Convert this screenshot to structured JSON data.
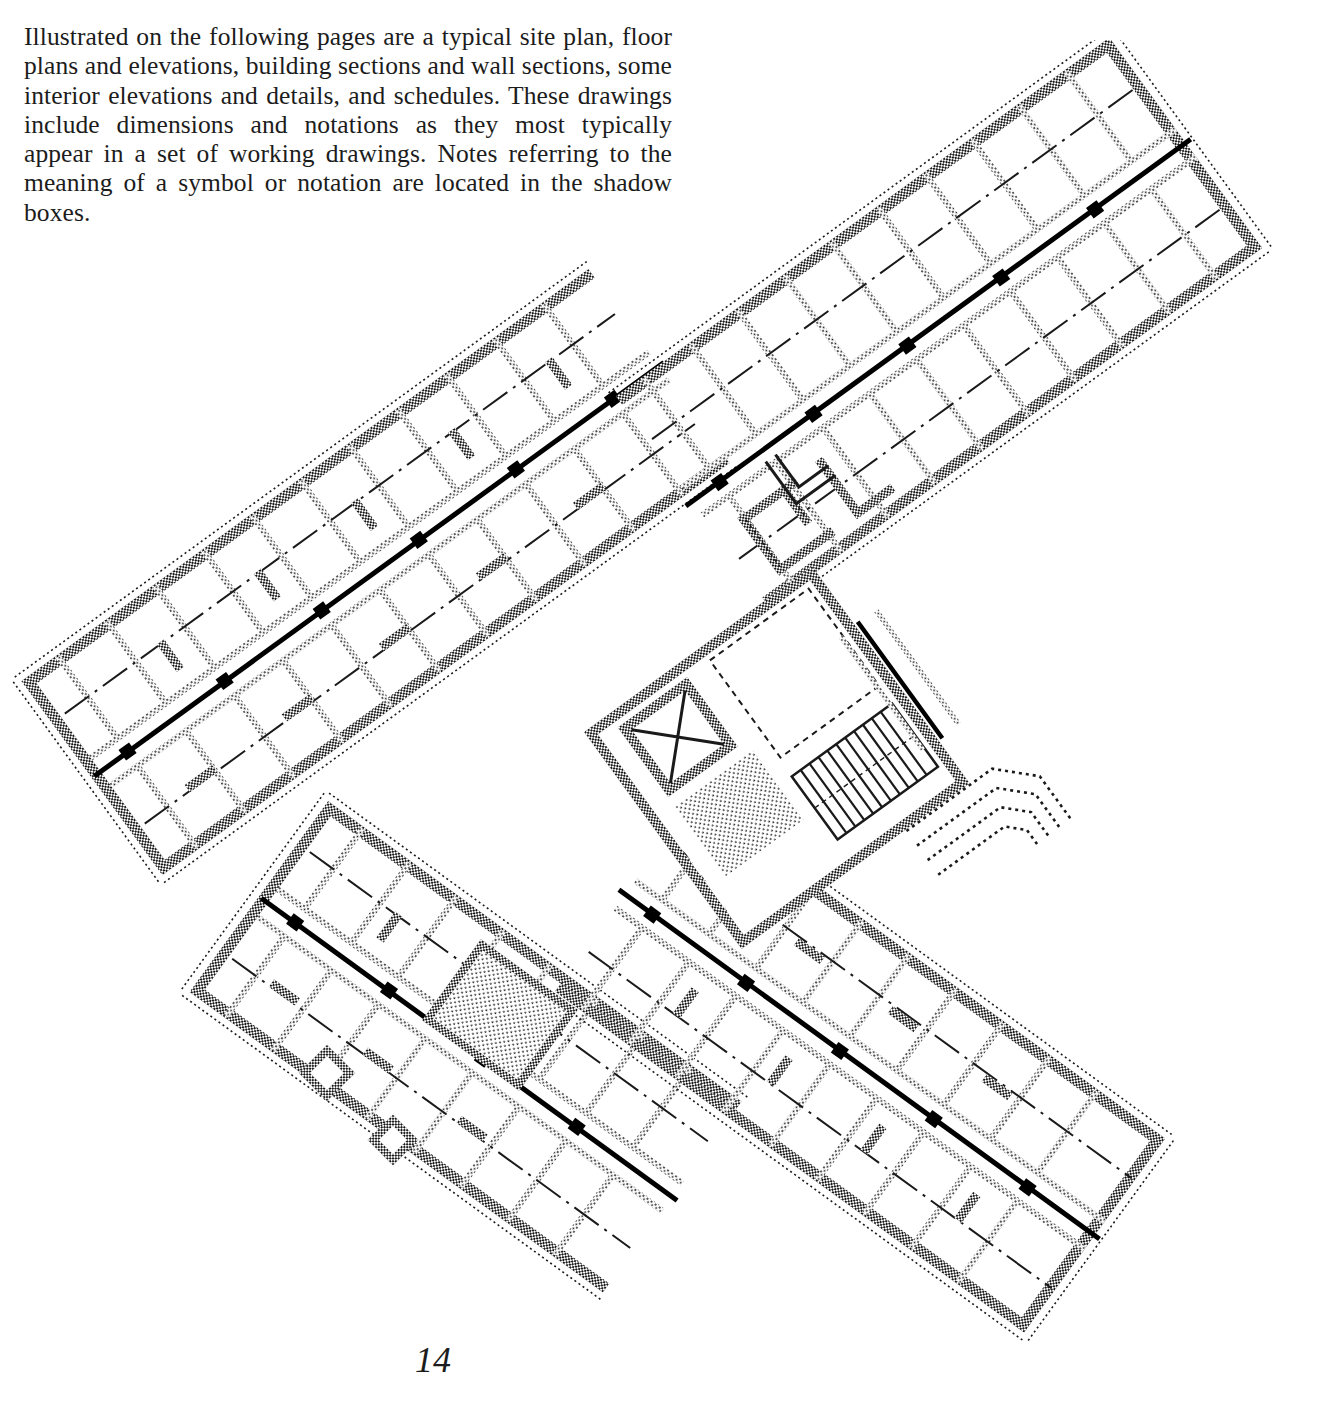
{
  "page": {
    "number": "14",
    "background_color": "#ffffff",
    "ink_color": "#1c1c1c"
  },
  "intro": {
    "lines": [
      "Illustrated on the following pages are a typical site plan,",
      "floor plans and elevations, building sections and wall",
      "sections, some interior elevations and details, and sched-",
      "ules. These drawings include dimensions and notations",
      "as they most typically appear in a set of working draw-",
      "ings.  Notes referring to the meaning of a symbol or no-",
      "tation are located in the shadow boxes."
    ],
    "paragraph": "Illustrated on the following pages are a typical site plan, floor plans and elevations, building sections and wall sections, some interior elevations and details, and schedules. These drawings include dimensions and notations as they most typically appear in a set of working drawings.  Notes referring to the meaning of a symbol or notation are located in the shadow boxes."
  },
  "figure": {
    "name": "typical-floor-plan",
    "drawing_conventions": {
      "wall_fill": "halftone stipple",
      "corridor_centerline": "heavy solid line with dash-dot room centerlines",
      "column_marker": "solid square at grid intersection",
      "stair_symbol": "parallel tread lines",
      "elevator_symbol": "box with diagonal cross"
    },
    "wings": [
      {
        "id": "wing-nw",
        "label": "northwest wing",
        "rotation_deg": -35,
        "rooms": 16
      },
      {
        "id": "wing-ne",
        "label": "northeast wing",
        "rotation_deg": 35,
        "rooms": 20
      },
      {
        "id": "wing-sw",
        "label": "southwest wing",
        "rotation_deg": 35,
        "rooms": 14
      },
      {
        "id": "wing-se",
        "label": "southeast wing",
        "rotation_deg": -35,
        "rooms": 18
      }
    ],
    "core": {
      "id": "central-core",
      "elements": [
        "stair",
        "elevator",
        "mechanical-shaft",
        "lobby"
      ]
    }
  }
}
